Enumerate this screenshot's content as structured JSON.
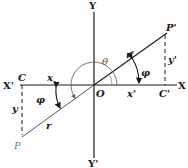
{
  "diagram": {
    "type": "coordinate-geometry",
    "axes": {
      "x_pos": "X",
      "x_neg": "X'",
      "y_pos": "Y",
      "y_neg": "Y'",
      "origin": "O"
    },
    "points": {
      "p_prime": "P'",
      "p": "P",
      "c": "C",
      "c_prime": "C'"
    },
    "segments": {
      "x": "x",
      "x_prime": "x'",
      "y": "y",
      "y_prime": "y'",
      "r": "r",
      "r_prime": "r'"
    },
    "angles": {
      "theta": "θ",
      "phi_right": "φ",
      "phi_left": "φ"
    },
    "colors": {
      "line": "#1a1a1a",
      "arc": "#6a6a6a",
      "p_label": "#7a7a7a"
    }
  }
}
